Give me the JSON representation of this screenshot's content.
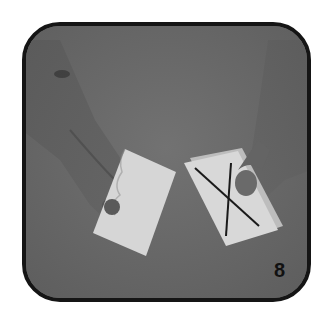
{
  "photo": {
    "description": "Hands holding two cards: left card blank, right card marked with an X",
    "step_number": "8",
    "colors": {
      "background": "#6b6b6b",
      "frame_border": "#151515",
      "card": "#d8d8d8",
      "mark": "#1a1a1a"
    }
  }
}
